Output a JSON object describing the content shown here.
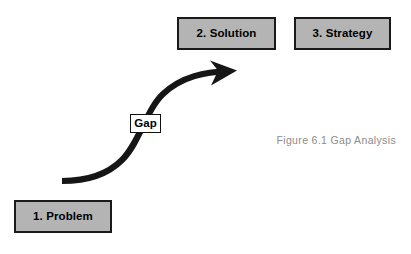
{
  "figure": {
    "type": "gap-analysis-diagram",
    "caption": "Figure 6.1 Gap Analysis",
    "background_color": "#ffffff"
  },
  "boxes": [
    {
      "id": "problem",
      "label": "1. Problem",
      "fill_color": "#b4b4b4",
      "border_color": "#1a1a1a",
      "text_color": "#000000",
      "position": {
        "x": 14,
        "y": 200,
        "width": 98,
        "height": 33
      }
    },
    {
      "id": "solution",
      "label": "2. Solution",
      "fill_color": "#b4b4b4",
      "border_color": "#1a1a1a",
      "text_color": "#000000",
      "position": {
        "x": 177,
        "y": 17,
        "width": 99,
        "height": 33
      }
    },
    {
      "id": "strategy",
      "label": "3. Strategy",
      "fill_color": "#b4b4b4",
      "border_color": "#1a1a1a",
      "text_color": "#000000",
      "position": {
        "x": 294,
        "y": 17,
        "width": 97,
        "height": 33
      }
    }
  ],
  "gap_label": {
    "text": "Gap",
    "fill_color": "#ffffff",
    "border_color": "#111111",
    "text_color": "#000000",
    "position": {
      "x": 130,
      "y": 114,
      "width": 31,
      "height": 19
    }
  },
  "arrow": {
    "name": "gap-curve-arrow",
    "color": "#161616",
    "shape": "s-curve",
    "direction": "lower-left-to-upper-right",
    "start": {
      "x": 62,
      "y": 181
    },
    "end": {
      "x": 236,
      "y": 71
    },
    "stroke_width": 6
  },
  "caption": {
    "text": "Figure 6.1 Gap Analysis",
    "color": "#8c8c8c",
    "position": {
      "x": 256,
      "y": 134
    }
  }
}
